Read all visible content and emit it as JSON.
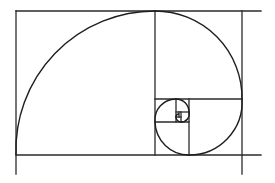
{
  "diagram": {
    "line_color": "#2a2a2a",
    "background_color": "#ffffff",
    "square_count": 9,
    "labels": []
  }
}
